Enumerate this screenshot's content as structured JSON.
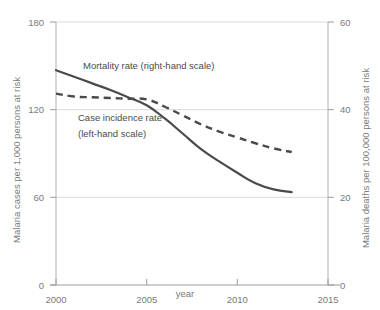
{
  "chart_data": {
    "type": "line",
    "title": "",
    "subtitle": "",
    "xlabel": "year",
    "ylabel": "Malaria cases per 1,000 persons at risk",
    "ylabel_right": "Malaria deaths per 100,000 persons at risk",
    "xlim": [
      2000,
      2015
    ],
    "ylim": [
      0,
      180
    ],
    "ylim_right": [
      0,
      60
    ],
    "xticks": [
      "2000",
      "2005",
      "2010",
      "2015"
    ],
    "xtick_values": [
      2000,
      2005,
      2010,
      2015
    ],
    "yticks": [
      "0",
      "60",
      "120",
      "180"
    ],
    "ytick_values": [
      0,
      60,
      120,
      180
    ],
    "yticks_right": [
      "0",
      "20",
      "40",
      "60"
    ],
    "ytick_right_values": [
      0,
      20,
      40,
      60
    ],
    "grid": true,
    "grid_axis": "y",
    "legend_position": "inline-annotations",
    "line_color": "#4a4a4a",
    "grid_color": "#d9d9d9",
    "axis_color": "#b0b0b0",
    "x": [
      2000,
      2001,
      2002,
      2003,
      2004,
      2005,
      2006,
      2007,
      2008,
      2009,
      2010,
      2011,
      2012,
      2013
    ],
    "series": [
      {
        "name": "Mortality rate (right-hand scale)",
        "axis": "right",
        "style": "solid",
        "values": [
          49.0,
          47.5,
          46.0,
          44.5,
          42.8,
          41.0,
          38.0,
          34.5,
          31.0,
          28.2,
          25.6,
          23.2,
          21.8,
          21.2
        ]
      },
      {
        "name": "Case incidence rate (left-hand scale)",
        "axis": "left",
        "style": "dashed",
        "values": [
          131.0,
          129.0,
          128.5,
          128.0,
          127.5,
          127.0,
          122.0,
          116.0,
          110.0,
          105.0,
          101.0,
          97.0,
          93.5,
          91.0
        ]
      }
    ],
    "annotations": [
      {
        "name": "mortality-annotation",
        "text": "Mortality rate (right-hand scale)",
        "x": 83,
        "y": 69
      },
      {
        "name": "incidence-annotation-line1",
        "text": "Case incidence rate",
        "x": 78,
        "y": 121
      },
      {
        "name": "incidence-annotation-line2",
        "text": "(left-hand scale)",
        "x": 78,
        "y": 137
      }
    ]
  }
}
